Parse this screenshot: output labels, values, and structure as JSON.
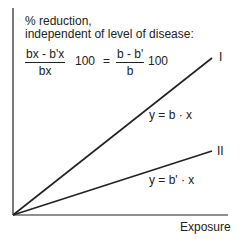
{
  "title_line1": "% reduction,",
  "title_line2": "independent of level of disease:",
  "formula": {
    "left_num": "bx - b'x",
    "left_den": "bx",
    "left_factor": "100",
    "equals": "=",
    "right_num": "b - b'",
    "right_den": "b",
    "right_factor": "100"
  },
  "lines": [
    {
      "label": "I",
      "equation": "y = b · x"
    },
    {
      "label": "II",
      "equation": "y = b' · x"
    }
  ],
  "x_axis_label": "Exposure"
}
